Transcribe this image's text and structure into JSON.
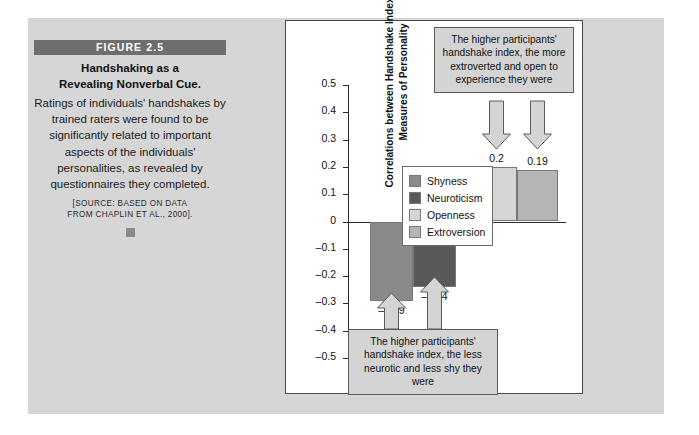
{
  "figure": {
    "banner": "FIGURE 2.5",
    "title_line1": "Handshaking as a",
    "title_line2": "Revealing Nonverbal Cue.",
    "body": "Ratings of individuals' handshakes by trained raters were found to be significantly related to important aspects of the individuals' personalities, as revealed by questionnaires they completed.",
    "source_line1": "[SOURCE: BASED ON DATA",
    "source_line2": "FROM CHAPLIN ET AL., 2000]."
  },
  "callouts": {
    "top": "The higher participants' handshake index, the more extroverted and open to experience they were",
    "bottom": "The higher participants' handshake index, the less neurotic and less shy they were"
  },
  "chart_data": {
    "type": "bar",
    "title": "",
    "xlabel": "",
    "ylabel": "Correlations between Handshake Index and Measures of Personality",
    "ylabel_line1": "Correlations between Handshake Index and",
    "ylabel_line2": "Measures of Personality",
    "categories": [
      "Shyness",
      "Neuroticism",
      "Openness",
      "Extroversion"
    ],
    "values": [
      -0.29,
      -0.24,
      0.2,
      0.19
    ],
    "value_labels": [
      "–0.29",
      "–0.24",
      "0.2",
      "0.19"
    ],
    "colors": [
      "#8a8a8a",
      "#595959",
      "#d6d6d6",
      "#b5b5b5"
    ],
    "ylim": [
      -0.5,
      0.5
    ],
    "yticks": [
      0.5,
      0.4,
      0.3,
      0.2,
      0.1,
      0,
      -0.1,
      -0.2,
      -0.3,
      -0.4,
      -0.5
    ],
    "ytick_labels": [
      "0.5",
      "0.4",
      "0.3",
      "0.2",
      "0.1",
      "0",
      "–0.1",
      "–0.2",
      "–0.3",
      "–0.4",
      "–0.5"
    ],
    "grid": false,
    "legend": {
      "position": "inside-right",
      "entries": [
        {
          "label": "Shyness",
          "color": "#8a8a8a"
        },
        {
          "label": "Neuroticism",
          "color": "#595959"
        },
        {
          "label": "Openness",
          "color": "#d6d6d6"
        },
        {
          "label": "Extroversion",
          "color": "#b5b5b5"
        }
      ]
    },
    "annotations": [
      {
        "text": "The higher participants' handshake index, the more extroverted and open to experience they were",
        "points_to": [
          "Openness",
          "Extroversion"
        ],
        "position": "top"
      },
      {
        "text": "The higher participants' handshake index, the less neurotic and less shy they were",
        "points_to": [
          "Shyness",
          "Neuroticism"
        ],
        "position": "bottom"
      }
    ]
  }
}
